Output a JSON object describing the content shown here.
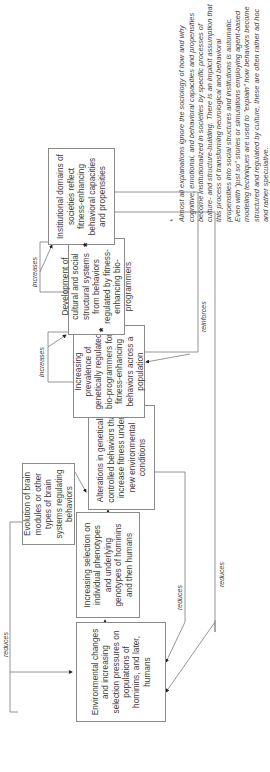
{
  "boxes": {
    "environmental": "Environmental changes and increasing selection pressures on populations of hominins, and later, humans",
    "selection": "Increasing selection on individual phenotypes and underlying genotypes of hominins and then humans",
    "brain": "Evolution of brain modules or other types of brain systems regulating behaviors",
    "alterations": "Alterations in genetically controlled behaviors that increase fitness under new environmental conditions",
    "prevalence": "Increasing prevalence of genetically regulated bio-programmers for fitness-enhancing behaviors across a population",
    "development": "Development of cultural and social structural systems from behaviors regulated by fitness-enhancing bio-programmers",
    "institutional": "Institutional domains of societies reflect fitness-enhancing behavioral capacities and propensities"
  },
  "labels": {
    "reduces_top": "reduces",
    "increases_1": "increases",
    "increases_2": "increases",
    "reinforces": "reinforces",
    "reduces_1": "reduces",
    "reduces_2": "reduces"
  },
  "star": "*",
  "footnote": {
    "marker": "*",
    "text": "Almost all explanations ignore the sociology of how and why cognitive, emotional, and behavioral capacities and propensities become institutionalized in societies by specific processes of culture- and structure-building. There is an implicit assumption that this process of transforming neurological and behavioral propensities into social structures and institutions is automatic. Even with \"just so\" stories or simulations employing agent-based modeling techniques are used to \"explain\" how behaviors become structured and regulated by culture, these are often rather ad hoc and rather speculative."
  }
}
